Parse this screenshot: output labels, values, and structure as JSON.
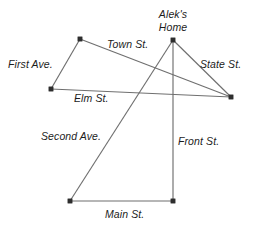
{
  "figure": {
    "kind": "street-map-diagram",
    "width": 254,
    "height": 227,
    "background_color": "#ffffff",
    "line_color": "#6f6f6f",
    "node_color": "#2e2e2e",
    "text_color": "#1c1c1c"
  },
  "places": [
    {
      "id": "aleks-home",
      "label_line1": "Alek's",
      "label_line2": "Home",
      "label_full": "Alek's Home",
      "x": 173,
      "y": 40
    }
  ],
  "nodes": [
    {
      "id": "n-home",
      "x": 173,
      "y": 40
    },
    {
      "id": "n-top-left",
      "x": 80,
      "y": 39
    },
    {
      "id": "n-left",
      "x": 51,
      "y": 89
    },
    {
      "id": "n-right",
      "x": 231,
      "y": 97
    },
    {
      "id": "n-bottom-left",
      "x": 70,
      "y": 201
    },
    {
      "id": "n-bottom-right",
      "x": 173,
      "y": 201
    }
  ],
  "streets": [
    {
      "id": "town-st",
      "name": "Town St.",
      "from": "n-top-left",
      "to": "n-right",
      "label_x": 107,
      "label_y": 38
    },
    {
      "id": "first-ave",
      "name": "First Ave.",
      "from": "n-top-left",
      "to": "n-left",
      "label_x": 8,
      "label_y": 58
    },
    {
      "id": "state-st",
      "name": "State St.",
      "from": "n-home",
      "to": "n-right",
      "label_x": 200,
      "label_y": 58
    },
    {
      "id": "elm-st",
      "name": "Elm St.",
      "from": "n-left",
      "to": "n-right",
      "label_x": 74,
      "label_y": 92
    },
    {
      "id": "second-ave",
      "name": "Second Ave.",
      "from": "n-home",
      "to": "n-bottom-left",
      "label_x": 41,
      "label_y": 130
    },
    {
      "id": "front-st",
      "name": "Front St.",
      "from": "n-home",
      "to": "n-bottom-right",
      "label_x": 178,
      "label_y": 135
    },
    {
      "id": "main-st",
      "name": "Main St.",
      "from": "n-bottom-left",
      "to": "n-bottom-right",
      "label_x": 105,
      "label_y": 208
    }
  ]
}
